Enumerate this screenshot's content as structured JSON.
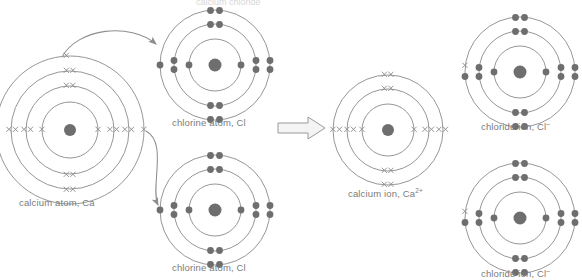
{
  "figure": {
    "top_cut_text": "calcium chloride",
    "background_color": "#ffffff",
    "shell_stroke": "#8a8a8a",
    "nucleus_color": "#6e6e6e",
    "electron_dot_color": "#6e6e6e",
    "electron_cross_color": "#8f8f8f",
    "arrow_color": "#9a9a9a",
    "label_color": "#7b7b7b"
  },
  "species": [
    {
      "id": "calcium-atom",
      "label": "calcium atom, Ca",
      "label_base": "calcium atom, Ca",
      "charge": "",
      "electron_style": "cross",
      "shell_count": 4,
      "shell_electrons": [
        2,
        8,
        8,
        2
      ],
      "center": {
        "x": 70,
        "y": 130
      },
      "radii": [
        28,
        44,
        59,
        74
      ]
    },
    {
      "id": "chlorine-atom-top",
      "label": "chlorine atom, Cl",
      "label_base": "chlorine atom, Cl",
      "charge": "",
      "electron_style": "dot",
      "shell_count": 3,
      "shell_electrons": [
        2,
        8,
        7
      ],
      "center": {
        "x": 215,
        "y": 65
      },
      "radii": [
        26,
        41,
        55
      ]
    },
    {
      "id": "chlorine-atom-bottom",
      "label": "chlorine atom, Cl",
      "label_base": "chlorine atom, Cl",
      "charge": "",
      "electron_style": "dot",
      "shell_count": 3,
      "shell_electrons": [
        2,
        8,
        7
      ],
      "center": {
        "x": 215,
        "y": 210
      },
      "radii": [
        26,
        41,
        55
      ]
    },
    {
      "id": "calcium-ion",
      "label": "calcium ion, Ca2+",
      "label_base": "calcium ion, Ca",
      "charge": "2+",
      "electron_style": "cross",
      "shell_count": 3,
      "shell_electrons": [
        2,
        8,
        8
      ],
      "center": {
        "x": 388,
        "y": 130
      },
      "radii": [
        26,
        41,
        55
      ]
    },
    {
      "id": "chloride-ion-top",
      "label": "chloride ion, Cl-",
      "label_base": "chloride ion, Cl",
      "charge": "–",
      "electron_style": "dot",
      "shell_count": 3,
      "shell_electrons": [
        2,
        8,
        8
      ],
      "transferred_electron_style": "cross",
      "center": {
        "x": 520,
        "y": 72
      },
      "radii": [
        26,
        41,
        55
      ]
    },
    {
      "id": "chloride-ion-bottom",
      "label": "chloride ion, Cl-",
      "label_base": "chloride ion, Cl",
      "charge": "–",
      "electron_style": "dot",
      "shell_count": 3,
      "shell_electrons": [
        2,
        8,
        8
      ],
      "transferred_electron_style": "cross",
      "center": {
        "x": 520,
        "y": 218
      },
      "radii": [
        26,
        41,
        55
      ]
    }
  ],
  "transfer_arrows": [
    {
      "id": "electron-transfer-arrow-up",
      "from": "calcium-atom",
      "to": "chlorine-atom-top"
    },
    {
      "id": "electron-transfer-arrow-down",
      "from": "calcium-atom",
      "to": "chlorine-atom-bottom"
    }
  ],
  "reaction_arrow": {
    "id": "reaction-arrow",
    "direction": "right",
    "x": 278,
    "y": 118
  }
}
